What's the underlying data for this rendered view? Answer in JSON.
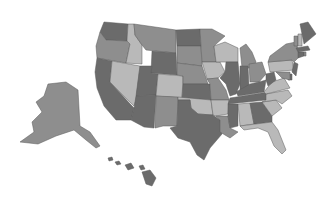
{
  "map": {
    "type": "choropleth",
    "region": "United States",
    "palette": {
      "dark": "#6b6b6b",
      "medium": "#8e8e8e",
      "light": "#b9b9b9",
      "background": "#ffffff",
      "border": "#5a5a5a"
    },
    "states": [
      {
        "id": "WA",
        "shade": "dark",
        "points": "104,22 128,24 127,41 106,40 100,32"
      },
      {
        "id": "OR",
        "shade": "medium",
        "points": "100,32 106,40 127,41 130,44 126,63 97,58 96,46"
      },
      {
        "id": "CA",
        "shade": "dark",
        "points": "97,58 112,61 110,82 134,108 131,120 116,120 104,106 97,88 95,72"
      },
      {
        "id": "ID",
        "shade": "light",
        "points": "128,24 134,24 135,35 142,45 142,64 126,63 130,44 127,41"
      },
      {
        "id": "NV",
        "shade": "light",
        "points": "112,61 140,66 136,100 134,106 110,82"
      },
      {
        "id": "MT",
        "shade": "medium",
        "points": "134,24 176,30 176,53 146,50 142,45 135,35"
      },
      {
        "id": "WY",
        "shade": "dark",
        "points": "152,51 176,53 177,75 151,73"
      },
      {
        "id": "UT",
        "shade": "dark",
        "points": "140,66 152,66 151,73 158,74 156,95 136,96"
      },
      {
        "id": "AZ",
        "shade": "dark",
        "points": "136,96 156,95 154,128 144,127 131,120 134,108"
      },
      {
        "id": "CO",
        "shade": "light",
        "points": "158,74 183,76 182,98 156,96"
      },
      {
        "id": "NM",
        "shade": "medium",
        "points": "156,96 178,97 177,126 163,126 155,128"
      },
      {
        "id": "ND",
        "shade": "dark",
        "points": "176,30 200,29 201,46 177,46"
      },
      {
        "id": "SD",
        "shade": "medium",
        "points": "177,46 201,46 202,66 177,63"
      },
      {
        "id": "NE",
        "shade": "medium",
        "points": "177,63 202,66 208,84 183,84 183,76 177,75"
      },
      {
        "id": "KS",
        "shade": "dark",
        "points": "183,84 210,84 211,100 182,98"
      },
      {
        "id": "OK",
        "shade": "light",
        "points": "178,97 211,100 213,115 198,114 191,108 190,100 178,100"
      },
      {
        "id": "TX",
        "shade": "dark",
        "points": "178,100 190,100 191,108 198,114 213,115 220,120 222,134 210,148 204,160 197,155 190,142 178,138 170,128 177,126"
      },
      {
        "id": "MN",
        "shade": "medium",
        "points": "200,29 212,29 225,36 214,46 216,62 202,62 201,46"
      },
      {
        "id": "IA",
        "shade": "light",
        "points": "202,62 220,62 225,72 218,78 207,79 205,72"
      },
      {
        "id": "MO",
        "shade": "medium",
        "points": "207,79 218,78 226,90 229,100 211,100 210,84"
      },
      {
        "id": "AR",
        "shade": "light",
        "points": "211,100 229,100 228,114 216,116 213,115"
      },
      {
        "id": "LA",
        "shade": "medium",
        "points": "216,116 228,116 230,128 238,132 230,138 220,132 220,120"
      },
      {
        "id": "WI",
        "shade": "light",
        "points": "214,46 225,42 238,48 238,62 220,62 216,62"
      },
      {
        "id": "IL",
        "shade": "dark",
        "points": "226,62 238,62 240,84 236,94 230,96 226,84 220,78 225,72"
      },
      {
        "id": "MI",
        "shade": "medium",
        "points": "240,48 246,44 252,52 256,62 252,68 242,68"
      },
      {
        "id": "IN",
        "shade": "dark",
        "points": "240,66 248,66 249,86 240,90"
      },
      {
        "id": "OH",
        "shade": "medium",
        "points": "249,64 262,62 266,74 259,82 250,82"
      },
      {
        "id": "KY",
        "shade": "dark",
        "points": "236,92 250,84 259,82 266,80 264,92 238,96"
      },
      {
        "id": "TN",
        "shade": "dark",
        "points": "230,98 268,92 266,100 228,104"
      },
      {
        "id": "MS",
        "shade": "dark",
        "points": "228,104 238,104 238,126 230,128 228,116"
      },
      {
        "id": "AL",
        "shade": "light",
        "points": "238,104 250,103 254,124 240,126"
      },
      {
        "id": "GA",
        "shade": "dark",
        "points": "250,103 262,102 272,116 272,122 256,124 254,124"
      },
      {
        "id": "FL",
        "shade": "light",
        "points": "240,126 256,124 272,122 278,130 286,150 282,154 274,146 268,132 258,128 244,130"
      },
      {
        "id": "SC",
        "shade": "light",
        "points": "262,102 276,100 282,108 272,116"
      },
      {
        "id": "NC",
        "shade": "light",
        "points": "266,94 288,90 292,96 282,104 276,100 262,102 266,100"
      },
      {
        "id": "VA",
        "shade": "light",
        "points": "264,92 272,82 284,78 290,88 266,94"
      },
      {
        "id": "WV",
        "shade": "dark",
        "points": "266,74 274,72 276,80 268,86 266,80"
      },
      {
        "id": "PA",
        "shade": "light",
        "points": "268,62 292,60 294,70 270,72"
      },
      {
        "id": "NY",
        "shade": "medium",
        "points": "270,56 286,44 296,42 300,56 294,62 292,60 268,62"
      },
      {
        "id": "NJ",
        "shade": "dark",
        "points": "294,62 298,64 296,76 292,72"
      },
      {
        "id": "DE",
        "shade": "dark",
        "points": "288,74 292,74 292,80 288,80"
      },
      {
        "id": "MD",
        "shade": "medium",
        "points": "276,72 290,72 290,80 282,78"
      },
      {
        "id": "CT",
        "shade": "dark",
        "points": "298,52 304,52 304,56 298,58"
      },
      {
        "id": "RI",
        "shade": "medium",
        "points": "304,52 306,52 306,56 304,56"
      },
      {
        "id": "MA",
        "shade": "dark",
        "points": "296,48 308,46 310,50 298,52"
      },
      {
        "id": "VT",
        "shade": "medium",
        "points": "294,36 298,36 298,46 294,46"
      },
      {
        "id": "NH",
        "shade": "light",
        "points": "298,34 302,34 302,46 298,46"
      },
      {
        "id": "ME",
        "shade": "dark",
        "points": "300,24 308,22 316,34 304,44 302,34"
      },
      {
        "id": "AK",
        "shade": "medium",
        "points": "48,84 66,82 78,90 80,126 90,132 100,146 96,148 86,140 74,130 56,136 38,144 20,142 34,132 32,122 42,112 36,102 44,96"
      },
      {
        "id": "HI-1",
        "shade": "dark",
        "points": "108,158 112,157 113,160 109,161"
      },
      {
        "id": "HI-2",
        "shade": "dark",
        "points": "115,162 119,161 121,164 117,165"
      },
      {
        "id": "HI-3",
        "shade": "dark",
        "points": "125,165 131,163 134,168 128,170"
      },
      {
        "id": "HI-4",
        "shade": "dark",
        "points": "139,166 143,165 145,169 141,170"
      },
      {
        "id": "HI-5",
        "shade": "dark",
        "points": "142,172 150,170 156,178 152,186 146,184"
      }
    ]
  }
}
